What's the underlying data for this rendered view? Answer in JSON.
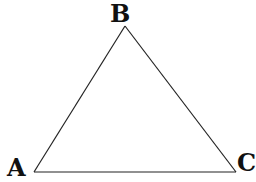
{
  "diagram": {
    "type": "triangle",
    "stroke_color": "#222222",
    "background": "#ffffff",
    "vertices": [
      {
        "id": "A",
        "label": "A",
        "x": 34,
        "y": 172
      },
      {
        "id": "B",
        "label": "B",
        "x": 125,
        "y": 26
      },
      {
        "id": "C",
        "label": "C",
        "x": 236,
        "y": 172
      }
    ],
    "edges": [
      {
        "from": "A",
        "to": "B"
      },
      {
        "from": "B",
        "to": "C"
      },
      {
        "from": "C",
        "to": "A"
      }
    ]
  }
}
